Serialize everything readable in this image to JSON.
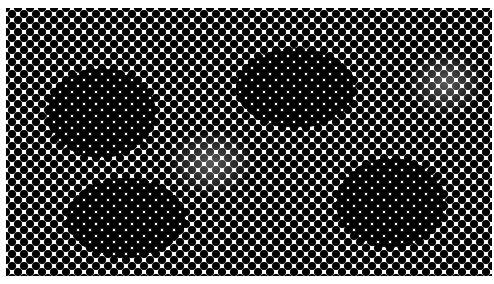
{
  "image": {
    "description": "Halftone dot pattern texture",
    "colors": {
      "dot": "#000000",
      "background": "#ffffff"
    },
    "dot_pitch_px": 12,
    "dark_patches": [
      {
        "x": 40,
        "y": 60,
        "w": 110,
        "h": 90
      },
      {
        "x": 230,
        "y": 40,
        "w": 120,
        "h": 80
      },
      {
        "x": 330,
        "y": 150,
        "w": 110,
        "h": 90
      },
      {
        "x": 60,
        "y": 170,
        "w": 120,
        "h": 80
      }
    ],
    "light_patches": [
      {
        "x": 160,
        "y": 120,
        "w": 90,
        "h": 70
      },
      {
        "x": 400,
        "y": 40,
        "w": 80,
        "h": 70
      }
    ]
  }
}
